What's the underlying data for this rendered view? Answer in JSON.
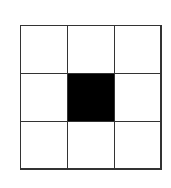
{
  "diagram": {
    "type": "grid",
    "rows": 3,
    "cols": 3,
    "cells": [
      {
        "row": 0,
        "col": 0,
        "filled": false
      },
      {
        "row": 0,
        "col": 1,
        "filled": false
      },
      {
        "row": 0,
        "col": 2,
        "filled": false
      },
      {
        "row": 1,
        "col": 0,
        "filled": false
      },
      {
        "row": 1,
        "col": 1,
        "filled": true
      },
      {
        "row": 1,
        "col": 2,
        "filled": false
      },
      {
        "row": 2,
        "col": 0,
        "filled": false
      },
      {
        "row": 2,
        "col": 1,
        "filled": false
      },
      {
        "row": 2,
        "col": 2,
        "filled": false
      }
    ],
    "colors": {
      "line": "#333333",
      "filled": "#000000",
      "empty": "#ffffff"
    }
  }
}
